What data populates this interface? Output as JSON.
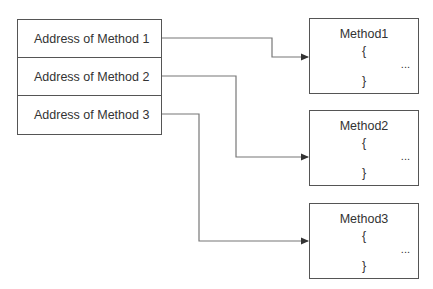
{
  "table": {
    "rows": [
      {
        "label": "Address of Method 1"
      },
      {
        "label": "Address of Method 2"
      },
      {
        "label": "Address of Method 3"
      }
    ]
  },
  "methods": [
    {
      "name": "Method1",
      "open": "{",
      "body": "...",
      "close": "}"
    },
    {
      "name": "Method2",
      "open": "{",
      "body": "...",
      "close": "}"
    },
    {
      "name": "Method3",
      "open": "{",
      "body": "...",
      "close": "}"
    }
  ],
  "colors": {
    "line": "#555555",
    "text": "#333333",
    "background": "#ffffff"
  }
}
